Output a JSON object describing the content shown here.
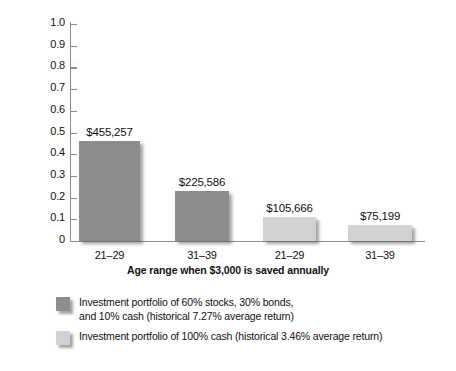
{
  "chart_data": {
    "type": "bar",
    "title": "",
    "xlabel": "Age range when $3,000 is saved annually",
    "ylabel": "Value of savings at age 65",
    "ylim": [
      0,
      1.0
    ],
    "grid": false,
    "legend_position": "bottom-left",
    "categories": [
      "21–29",
      "31–39",
      "21–29",
      "31–39"
    ],
    "values": [
      0.46,
      0.23,
      0.11,
      0.076
    ],
    "data_labels": [
      "$455,257",
      "$225,586",
      "$105,666",
      "$75,199"
    ],
    "series_of_bar": [
      "a",
      "b",
      "b",
      "b"
    ],
    "bars": [
      {
        "category": "21–29",
        "value": 0.46,
        "label": "$455,257",
        "series": "a"
      },
      {
        "category": "31–39",
        "value": 0.23,
        "label": "$225,586",
        "series": "a"
      },
      {
        "category": "21–29",
        "value": 0.11,
        "label": "$105,666",
        "series": "b"
      },
      {
        "category": "31–39",
        "value": 0.076,
        "label": "$75,199",
        "series": "b"
      }
    ],
    "y_ticks": [
      "1.0",
      "0.9",
      "0.8",
      "0.7",
      "0.6",
      "0.5",
      "0.4",
      "0.3",
      "0.2",
      "0.1",
      "0"
    ],
    "series": [
      {
        "name": "a",
        "legend": "Investment portfolio of 60% stocks, 30% bonds,\nand 10% cash (historical 7.27% average return)",
        "color": "#8d8d8d"
      },
      {
        "name": "b",
        "legend": "Investment portfolio of 100% cash (historical 3.46% average return)",
        "color": "#d2d2d2"
      }
    ]
  },
  "colors": {
    "series_a": "#8d8d8d",
    "series_b": "#d2d2d2",
    "axis": "#8d8d8d",
    "text": "#111111",
    "background": "#ffffff"
  }
}
